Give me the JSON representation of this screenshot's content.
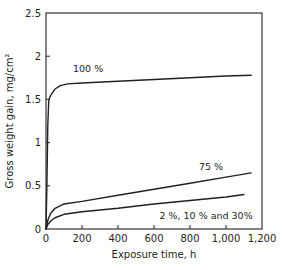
{
  "chart_data": {
    "type": "line",
    "title": "",
    "xlabel": "Exposure time, h",
    "ylabel": "Gross weight gain, mg/cm²",
    "xlim": [
      0,
      1200
    ],
    "ylim": [
      0,
      2.5
    ],
    "grid": false,
    "legend": "inline labels",
    "x_ticks": [
      0,
      200,
      400,
      600,
      800,
      1000,
      1200
    ],
    "x_tick_labels": [
      "0",
      "200",
      "400",
      "600",
      "800",
      "1,000",
      "1,200"
    ],
    "y_ticks": [
      0,
      0.5,
      1,
      1.5,
      2,
      2.5
    ],
    "y_tick_labels": [
      "0",
      "0.5",
      "1",
      "1.5",
      "2",
      "2.5"
    ],
    "series": [
      {
        "name": "100 %",
        "label_pos": [
          150,
          1.82
        ],
        "x": [
          0,
          5,
          10,
          15,
          20,
          30,
          50,
          80,
          120,
          200,
          400,
          600,
          800,
          1000,
          1140
        ],
        "y": [
          0,
          0.5,
          1.2,
          1.48,
          1.52,
          1.56,
          1.62,
          1.66,
          1.68,
          1.69,
          1.71,
          1.73,
          1.75,
          1.77,
          1.78
        ]
      },
      {
        "name": "75 %",
        "label_pos": [
          850,
          0.68
        ],
        "x": [
          0,
          10,
          25,
          50,
          100,
          200,
          400,
          600,
          800,
          1000,
          1140
        ],
        "y": [
          0,
          0.1,
          0.18,
          0.24,
          0.29,
          0.32,
          0.39,
          0.46,
          0.53,
          0.6,
          0.65
        ]
      },
      {
        "name": "2 %, 10 % and 30%",
        "label_pos": [
          630,
          0.12
        ],
        "x": [
          0,
          10,
          25,
          50,
          100,
          200,
          400,
          600,
          800,
          1000,
          1100
        ],
        "y": [
          0,
          0.05,
          0.09,
          0.13,
          0.17,
          0.2,
          0.24,
          0.29,
          0.33,
          0.37,
          0.4
        ]
      }
    ]
  }
}
